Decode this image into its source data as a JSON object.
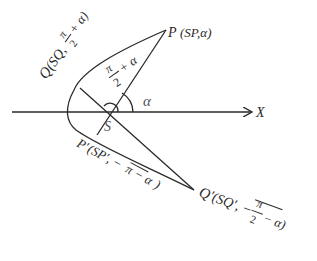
{
  "diagram": {
    "type": "polar-coordinate focal chord figure",
    "points": {
      "origin": {
        "label": "S",
        "x": 110,
        "y": 112
      },
      "P": {
        "label": "P",
        "coords": "(SP,α)",
        "x": 166,
        "y": 30
      },
      "Q": {
        "label": "Q",
        "coords_prefix": "(SQ,",
        "frac_num": "π",
        "frac_den": "2",
        "coords_suffix": "+ α)",
        "x": 80,
        "y": 88
      },
      "P_prime": {
        "label": "P′",
        "coords_prefix": "(SP′, −",
        "overline_term": "π − α",
        "coords_suffix": ")",
        "x": 97,
        "y": 135
      },
      "Q_prime": {
        "label": "Q′",
        "coords_prefix": "(SQ′, −",
        "frac_num": "π",
        "frac_den": "2",
        "coords_suffix": "− α)",
        "x": 194,
        "y": 190
      }
    },
    "axis": {
      "label": "X"
    },
    "angles": {
      "alpha": "α",
      "pi_over_2_plus_alpha": {
        "num": "π",
        "den": "2",
        "suffix": "+ α"
      }
    },
    "colors": {
      "stroke": "#2a2a2a",
      "text": "#2a2a2a",
      "background": "#ffffff"
    }
  }
}
